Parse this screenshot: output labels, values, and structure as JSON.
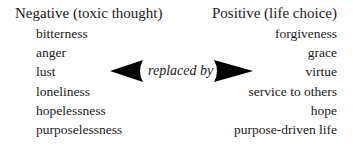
{
  "negative": {
    "heading": "Negative (toxic thought)",
    "items": [
      "bitterness",
      "anger",
      "lust",
      "loneliness",
      "hopelessness",
      "purposelessness"
    ]
  },
  "positive": {
    "heading": "Positive (life choice)",
    "items": [
      "forgiveness",
      "grace",
      "virtue",
      "service to others",
      "hope",
      "purpose-driven life"
    ]
  },
  "connector": {
    "label": "replaced by",
    "left_icon": "arrow-left-icon",
    "right_icon": "arrow-right-icon",
    "color": "#000000"
  }
}
